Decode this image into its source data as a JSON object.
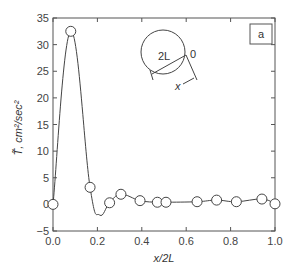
{
  "chart_data": {
    "type": "line",
    "title": "",
    "panel_label": "a",
    "xlabel": "x/2L",
    "ylabel": "T̃, cm²/sec²",
    "xlim": [
      0.0,
      1.0
    ],
    "ylim": [
      -5,
      35
    ],
    "x_ticks": [
      0.0,
      0.2,
      0.4,
      0.6,
      0.8,
      1.0
    ],
    "x_tick_labels": [
      "0.0",
      "0.2",
      "0.4",
      "0.6",
      "0.8",
      "1.0"
    ],
    "y_ticks": [
      -5,
      0,
      5,
      10,
      15,
      20,
      25,
      30,
      35
    ],
    "y_tick_labels": [
      "−5",
      "0",
      "5",
      "10",
      "15",
      "20",
      "25",
      "30",
      "35"
    ],
    "grid": false,
    "legend": null,
    "series": [
      {
        "name": "T̃ (measured)",
        "marker": "open-circle",
        "points": [
          {
            "x": 0.0,
            "y": 0.0
          },
          {
            "x": 0.08,
            "y": 32.5
          },
          {
            "x": 0.167,
            "y": 3.2
          },
          {
            "x": 0.255,
            "y": 0.3
          },
          {
            "x": 0.306,
            "y": 1.9
          },
          {
            "x": 0.392,
            "y": 0.7
          },
          {
            "x": 0.47,
            "y": 0.4
          },
          {
            "x": 0.509,
            "y": 0.4
          },
          {
            "x": 0.649,
            "y": 0.5
          },
          {
            "x": 0.737,
            "y": 0.8
          },
          {
            "x": 0.826,
            "y": 0.5
          },
          {
            "x": 0.941,
            "y": 1.0
          },
          {
            "x": 1.0,
            "y": 0.1
          }
        ]
      }
    ],
    "smooth_curve_min": {
      "x": 0.21,
      "y": -2.0
    },
    "inset": {
      "description": "circle of diameter 2L with chord, origin 0 and distance x",
      "labels": [
        "2L",
        "0",
        "x"
      ]
    }
  }
}
